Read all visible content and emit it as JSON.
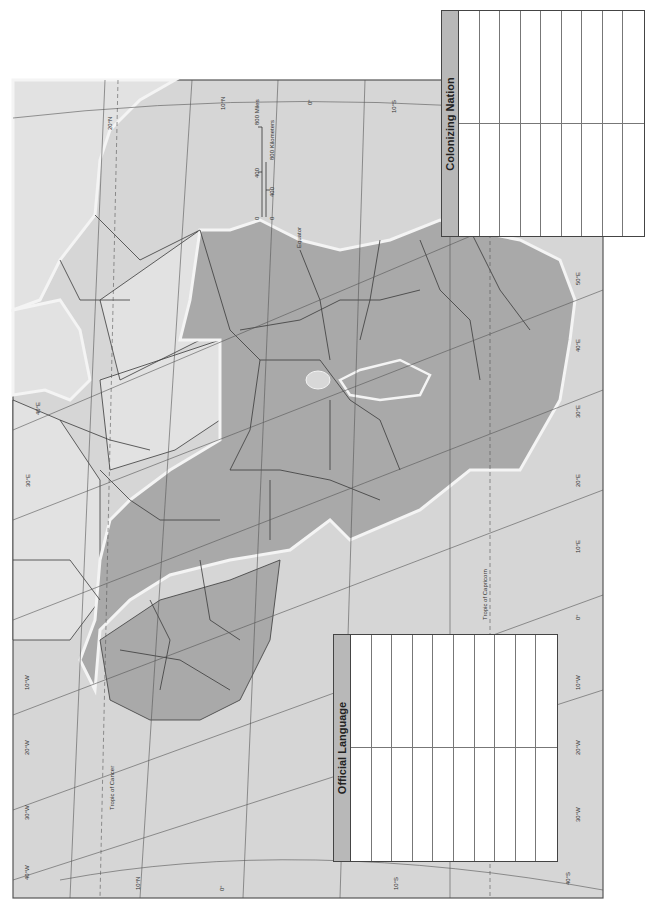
{
  "map": {
    "subject": "Africa (political outline, rotated)",
    "colors": {
      "ocean": "#d6d6d6",
      "land_light": "#e2e2e2",
      "land_dark": "#a9a9a9",
      "border": "#3a3a3a",
      "graticule": "#555555",
      "coast_glow": "#f4f4f4"
    },
    "special_lines": {
      "equator": "Equator",
      "tropic_of_cancer": "Tropic of Cancer",
      "tropic_of_capricorn": "Tropic of Capricorn"
    },
    "graticule_labels": {
      "top": [
        "20°N",
        "10°N",
        "0°",
        "10°S"
      ],
      "bottom": [
        "10°N",
        "0°",
        "10°S"
      ],
      "left": [
        "40°E",
        "30°E",
        "10°W",
        "20°W",
        "30°W",
        "40°W"
      ],
      "right": [
        "50°E",
        "40°E",
        "30°E",
        "20°E",
        "10°E",
        "0°",
        "10°W",
        "20°W",
        "30°W",
        "40°S"
      ]
    },
    "scale_bar": {
      "miles": [
        "0",
        "400",
        "800 Miles"
      ],
      "kilometers": [
        "0",
        "400",
        "800 Kilometers"
      ]
    }
  },
  "legends": {
    "official_language": {
      "title": "Official Language",
      "columns": 10,
      "rows": 2
    },
    "colonizing_nation": {
      "title": "Colonizing Nation",
      "columns": 9,
      "rows": 2
    }
  }
}
